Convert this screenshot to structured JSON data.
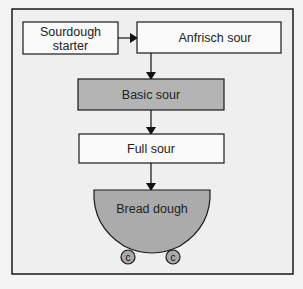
{
  "diagram": {
    "type": "flowchart",
    "nodes": {
      "starter": {
        "line1": "Sourdough",
        "line2": "starter",
        "fill": "#fafafa"
      },
      "anfrisch": {
        "label": "Anfrisch sour",
        "fill": "#fafafa"
      },
      "basic": {
        "label": "Basic sour",
        "fill": "#b4b4b4"
      },
      "full": {
        "label": "Full sour",
        "fill": "#fafafa"
      },
      "dough": {
        "label": "Bread dough",
        "fill": "#ababab"
      }
    },
    "wheels": [
      {
        "label": "c"
      },
      {
        "label": "c"
      }
    ],
    "edges": [
      {
        "from": "starter",
        "to": "anfrisch"
      },
      {
        "from": "anfrisch",
        "to": "basic"
      },
      {
        "from": "basic",
        "to": "full"
      },
      {
        "from": "full",
        "to": "dough"
      }
    ],
    "colors": {
      "background": "#f4f4f4",
      "frame_fill": "#efefef",
      "stroke": "#1a1a1a",
      "wheel_fill": "#a8a8a8"
    }
  }
}
